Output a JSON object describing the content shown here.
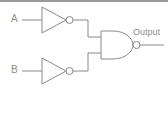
{
  "diagram": {
    "canvas": {
      "width": 168,
      "height": 121,
      "background": "#ffffff"
    },
    "colors": {
      "stroke": "#8a8a8a",
      "text": "#8d8d8d",
      "border": "#9a9a9a",
      "fill": "#ffffff"
    },
    "labels": {
      "input_a": "A",
      "input_b": "B",
      "output": "Output"
    },
    "gates": [
      {
        "id": "inverter-a",
        "type": "NOT",
        "symbol": "triangle-with-bubble",
        "inputs": [
          "A"
        ],
        "output": "not-A"
      },
      {
        "id": "inverter-b",
        "type": "NOT",
        "symbol": "triangle-with-bubble",
        "inputs": [
          "B"
        ],
        "output": "not-B"
      },
      {
        "id": "nand-gate",
        "type": "NAND",
        "symbol": "d-shape-with-bubble",
        "inputs": [
          "not-A",
          "not-B"
        ],
        "output": "Output"
      }
    ],
    "nets": [
      {
        "id": "net-a-in",
        "from": "A",
        "to": "inverter-a"
      },
      {
        "id": "net-b-in",
        "from": "B",
        "to": "inverter-b"
      },
      {
        "id": "net-nota",
        "from": "inverter-a",
        "to": "nand-gate"
      },
      {
        "id": "net-notb",
        "from": "inverter-b",
        "to": "nand-gate"
      },
      {
        "id": "net-out",
        "from": "nand-gate",
        "to": "Output"
      }
    ]
  }
}
